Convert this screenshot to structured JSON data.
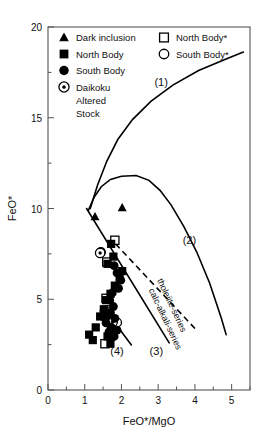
{
  "chart_data": {
    "type": "scatter",
    "title": "",
    "xlabel": "FeO*/MgO",
    "ylabel": "FeO*",
    "xlim": [
      0,
      5.5
    ],
    "ylim": [
      0,
      20
    ],
    "xticks": [
      "0",
      "1",
      "2",
      "3",
      "4",
      "5"
    ],
    "xtick_values": [
      0,
      1,
      2,
      3,
      4,
      5
    ],
    "xminor_values": [
      0.5,
      1.5,
      2.5,
      3.5,
      4.5,
      5.5
    ],
    "yticks": [
      "0",
      "5",
      "10",
      "15",
      "20"
    ],
    "ytick_values": [
      0,
      5,
      10,
      15,
      20
    ],
    "yminor_values": [
      2.5,
      7.5,
      12.5,
      17.5
    ],
    "grid": false,
    "legend_position": "top-inside",
    "series": [
      {
        "name": "Dark inclusion",
        "marker": "filled-triangle",
        "points": [
          [
            1.28,
            9.55
          ],
          [
            2.02,
            10.05
          ]
        ]
      },
      {
        "name": "North Body",
        "marker": "filled-square",
        "points": [
          [
            1.72,
            8.05
          ],
          [
            1.78,
            7.35
          ],
          [
            1.62,
            6.95
          ],
          [
            2.02,
            6.55
          ],
          [
            1.95,
            6.15
          ],
          [
            1.82,
            5.75
          ],
          [
            1.7,
            5.3
          ],
          [
            1.58,
            4.95
          ],
          [
            1.52,
            4.45
          ],
          [
            1.42,
            4.05
          ],
          [
            1.3,
            3.45
          ],
          [
            1.12,
            3.05
          ],
          [
            1.22,
            2.75
          ],
          [
            1.62,
            2.95
          ],
          [
            1.7,
            2.55
          ]
        ]
      },
      {
        "name": "South Body",
        "marker": "filled-circle",
        "points": [
          [
            1.8,
            6.85
          ],
          [
            1.88,
            6.45
          ],
          [
            1.98,
            6.05
          ],
          [
            1.92,
            5.6
          ],
          [
            1.75,
            5.35
          ],
          [
            1.68,
            4.95
          ],
          [
            1.78,
            4.6
          ],
          [
            1.7,
            4.25
          ],
          [
            1.6,
            4.05
          ],
          [
            1.82,
            3.95
          ],
          [
            1.58,
            3.7
          ],
          [
            1.72,
            3.45
          ],
          [
            1.66,
            3.2
          ],
          [
            1.88,
            3.3
          ],
          [
            1.8,
            2.95
          ]
        ]
      },
      {
        "name": "Daikoku Altered Stock",
        "marker": "dotted-circle",
        "points": [
          [
            1.42,
            7.55
          ],
          [
            1.55,
            4.35
          ],
          [
            1.76,
            3.75
          ]
        ]
      },
      {
        "name": "North Body*",
        "marker": "open-square",
        "points": [
          [
            1.82,
            8.25
          ],
          [
            1.6,
            7.05
          ],
          [
            1.58,
            5.05
          ],
          [
            1.55,
            2.55
          ]
        ]
      },
      {
        "name": "South Body*",
        "marker": "open-circle",
        "points": [
          [
            1.44,
            7.6
          ],
          [
            1.62,
            4.4
          ],
          [
            1.52,
            4.05
          ],
          [
            1.68,
            3.7
          ],
          [
            1.88,
            3.72
          ]
        ]
      }
    ],
    "annotations": [
      {
        "label": "(1)",
        "x": 3.08,
        "y": 16.75
      },
      {
        "label": "(2)",
        "x": 3.85,
        "y": 8.05
      },
      {
        "label": "(3)",
        "x": 2.95,
        "y": 1.95
      },
      {
        "label": "(4)",
        "x": 1.88,
        "y": 1.95
      },
      {
        "label": "tholeiite-series",
        "x": 3.3,
        "y": 4.6,
        "rotated": true
      },
      {
        "label": "calc-alkali-series",
        "x": 3.12,
        "y": 3.85,
        "rotated": true
      }
    ],
    "boundary_curves": [
      {
        "name": "(1)",
        "style": "solid",
        "description": "rising curve from (1.15,10.0) to (5.3,18.6)"
      },
      {
        "name": "(2)",
        "style": "solid",
        "description": "arched curve from (1.1,9.9) peaking near (2.4,11.8) descending to (4.7,3.6)"
      },
      {
        "name": "(3)",
        "style": "solid",
        "description": "straight line from (1.05,10.0) to (3.3,2.6)"
      },
      {
        "name": "(4)",
        "style": "solid",
        "description": "straight line from (1.6,4.3) to (2.25,2.5)"
      },
      {
        "name": "tholeiite-series",
        "style": "dashed",
        "description": "dashed divider from (1.85,8.0) to (4.0,3.4)"
      }
    ]
  },
  "legend": {
    "left_column": [
      {
        "label": "Dark inclusion",
        "marker": "filled-triangle"
      },
      {
        "label": "North Body",
        "marker": "filled-square"
      },
      {
        "label": "South Body",
        "marker": "filled-circle"
      },
      {
        "label": "Daikoku",
        "marker": "dotted-circle"
      },
      {
        "label": "Altered",
        "marker": "none"
      },
      {
        "label": "Stock",
        "marker": "none"
      }
    ],
    "right_column": [
      {
        "label": "North Body*",
        "marker": "open-square"
      },
      {
        "label": "South Body*",
        "marker": "open-circle"
      }
    ]
  },
  "colors": {
    "marker": "#000000",
    "axis": "#555555",
    "background": "#ffffff",
    "text": "#111111"
  }
}
